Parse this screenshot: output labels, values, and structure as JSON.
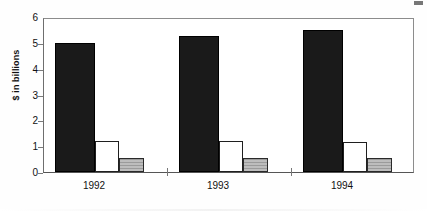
{
  "chart_data": {
    "type": "bar",
    "title": "",
    "xlabel": "",
    "ylabel": "$ in billions",
    "categories": [
      "1992",
      "1993",
      "1994"
    ],
    "yticks": [
      "6",
      "5",
      "4",
      "3",
      "2",
      "1",
      "0"
    ],
    "ylim": [
      0,
      6
    ],
    "grid": false,
    "legend": "none",
    "series": [
      {
        "name": "series-1-black",
        "style": "solid-black",
        "color": "#1a1a1a",
        "values": [
          5.0,
          5.25,
          5.5
        ]
      },
      {
        "name": "series-2-white",
        "style": "open-white",
        "color": "#ffffff",
        "values": [
          1.2,
          1.2,
          1.15
        ]
      },
      {
        "name": "series-3-gray",
        "style": "hatched-gray",
        "color": "#b0b0b0",
        "values": [
          0.55,
          0.55,
          0.55
        ]
      }
    ]
  },
  "axis": {
    "y_title": "$ in billions"
  }
}
